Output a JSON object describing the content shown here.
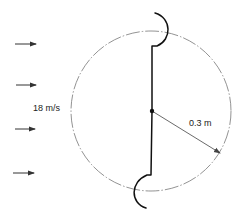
{
  "diagram": {
    "velocity_label": "18 m/s",
    "radius_label": "0.3 m",
    "colors": {
      "line": "#111111",
      "circle": "#777777",
      "arrow": "#333333",
      "text": "#222222"
    },
    "flow_arrows": [
      {
        "x1": 15,
        "x2": 36,
        "y": 44
      },
      {
        "x1": 16,
        "x2": 36,
        "y": 85
      },
      {
        "x1": 15,
        "x2": 35,
        "y": 129
      },
      {
        "x1": 13,
        "x2": 34,
        "y": 173
      }
    ],
    "swept_circle": {
      "cx": 151,
      "cy": 111,
      "r": 80
    },
    "center_point": {
      "cx": 152,
      "cy": 111
    }
  }
}
